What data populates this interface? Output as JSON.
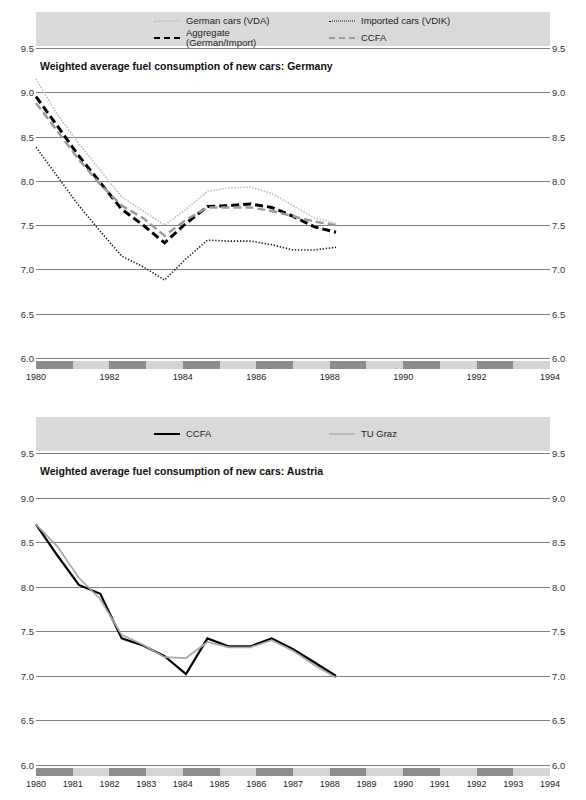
{
  "charts": [
    {
      "id": "germany",
      "title": "Weighted average fuel consumption of new cars: Germany",
      "legend": [
        {
          "label": "German cars (VDA)",
          "style": "dotted-light",
          "color": "#b0b0b0"
        },
        {
          "label": "Imported cars (VDIK)",
          "style": "dotted-dark",
          "color": "#111111"
        },
        {
          "label": "Aggregate (German/Import)",
          "style": "dash-black",
          "color": "#000000"
        },
        {
          "label": "CCFA",
          "style": "dash-gray",
          "color": "#9a9a9a"
        }
      ],
      "chart_data": {
        "type": "line",
        "title": "Weighted average fuel consumption of new cars: Germany",
        "xlabel": "",
        "ylabel": "",
        "ylim": [
          6.0,
          9.5
        ],
        "ytick_labels": [
          "6.0",
          "6.5",
          "7.0",
          "7.5",
          "8.0",
          "8.5",
          "9.0",
          "9.5"
        ],
        "yticks": [
          6.0,
          6.5,
          7.0,
          7.5,
          8.0,
          8.5,
          9.0,
          9.5
        ],
        "grid": true,
        "legend_position": "top",
        "x": [
          1980,
          1981,
          1982,
          1983,
          1984,
          1985,
          1986,
          1987,
          1988,
          1989,
          1990,
          1991,
          1992,
          1993,
          1994
        ],
        "xtick_labels": [
          "1980",
          "1982",
          "1984",
          "1986",
          "1988",
          "1990",
          "1992",
          "1994"
        ],
        "xticks": [
          1980,
          1982,
          1984,
          1986,
          1988,
          1990,
          1992,
          1994
        ],
        "series": [
          {
            "name": "German cars (VDA)",
            "values": [
              9.15,
              8.75,
              8.42,
              8.12,
              7.82,
              7.66,
              7.5,
              7.68,
              7.88,
              7.92,
              7.93,
              7.86,
              7.72,
              7.58,
              7.52
            ]
          },
          {
            "name": "Imported cars (VDIK)",
            "values": [
              8.38,
              8.05,
              7.72,
              7.43,
              7.15,
              7.03,
              6.88,
              7.12,
              7.33,
              7.32,
              7.32,
              7.28,
              7.22,
              7.22,
              7.25
            ]
          },
          {
            "name": "Aggregate (German/Import)",
            "values": [
              8.95,
              8.62,
              8.28,
              7.98,
              7.68,
              7.5,
              7.3,
              7.52,
              7.71,
              7.72,
              7.74,
              7.7,
              7.6,
              7.48,
              7.42
            ]
          },
          {
            "name": "CCFA",
            "values": [
              8.88,
              8.56,
              8.24,
              7.96,
              7.72,
              7.58,
              7.38,
              7.56,
              7.7,
              7.7,
              7.7,
              7.66,
              7.6,
              7.54,
              7.5
            ]
          }
        ]
      }
    },
    {
      "id": "austria",
      "title": "Weighted average fuel consumption of new cars: Austria",
      "legend": [
        {
          "label": "CCFA",
          "style": "solid-black",
          "color": "#000000"
        },
        {
          "label": "TU Graz",
          "style": "solid-gray",
          "color": "#9a9a9a"
        }
      ],
      "chart_data": {
        "type": "line",
        "title": "Weighted average fuel consumption of new cars: Austria",
        "xlabel": "",
        "ylabel": "",
        "ylim": [
          6.0,
          9.5
        ],
        "ytick_labels": [
          "6.0",
          "6.5",
          "7.0",
          "7.5",
          "8.0",
          "8.5",
          "9.0",
          "9.5"
        ],
        "yticks": [
          6.0,
          6.5,
          7.0,
          7.5,
          8.0,
          8.5,
          9.0,
          9.5
        ],
        "grid": true,
        "legend_position": "top",
        "x": [
          1980,
          1981,
          1982,
          1983,
          1984,
          1985,
          1986,
          1987,
          1988,
          1989,
          1990,
          1991,
          1992,
          1993,
          1994
        ],
        "xtick_labels": [
          "1980",
          "1981",
          "1982",
          "1983",
          "1984",
          "1985",
          "1986",
          "1987",
          "1988",
          "1989",
          "1990",
          "1991",
          "1992",
          "1993",
          "1994"
        ],
        "xticks": [
          1980,
          1981,
          1982,
          1983,
          1984,
          1985,
          1986,
          1987,
          1988,
          1989,
          1990,
          1991,
          1992,
          1993,
          1994
        ],
        "series": [
          {
            "name": "CCFA",
            "values": [
              8.7,
              8.35,
              8.02,
              7.92,
              7.42,
              7.34,
              7.22,
              7.02,
              7.42,
              7.33,
              7.33,
              7.42,
              7.3,
              7.15,
              7.0
            ]
          },
          {
            "name": "TU Graz",
            "values": [
              8.7,
              8.45,
              8.1,
              7.86,
              7.46,
              7.35,
              7.21,
              7.2,
              7.38,
              7.32,
              7.32,
              7.4,
              7.28,
              7.12,
              6.98
            ]
          }
        ]
      }
    }
  ]
}
